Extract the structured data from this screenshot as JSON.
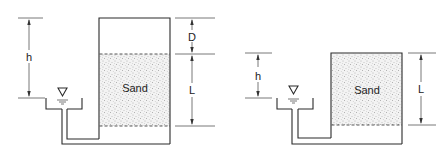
{
  "diagrams": [
    {
      "id": "left",
      "sand_label": "Sand",
      "dimensions": {
        "h": "h",
        "D": "D",
        "L": "L"
      }
    },
    {
      "id": "right",
      "sand_label": "Sand",
      "dimensions": {
        "h": "h",
        "L": "L"
      }
    }
  ],
  "colors": {
    "line": "#2a2a2a",
    "sand_dots": "#7a7a7a",
    "background": "#ffffff"
  }
}
